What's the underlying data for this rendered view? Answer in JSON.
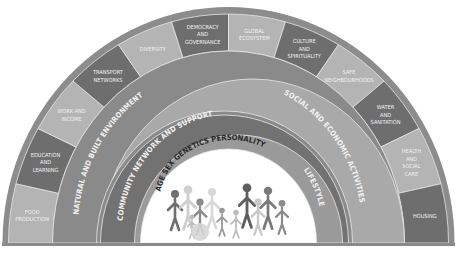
{
  "diagram": {
    "colors": {
      "outer_rim": "#8c8c8c",
      "segment_dark": "#6e6e6e",
      "segment_light": "#b4b4b4",
      "segment_divider": "#e6e6e6",
      "natural_built_band": "#8a8a8a",
      "social_economic_band": "#a9a9a9",
      "community_band": "#727272",
      "lifestyle_band": "#9a9a9a",
      "core": "#ffffff",
      "baseline": "#808080"
    },
    "outer_segments": [
      {
        "lines": [
          "FOOD",
          "PRODUCTION"
        ],
        "shade": "light"
      },
      {
        "lines": [
          "EDUCATION",
          "AND",
          "LEARNING"
        ],
        "shade": "dark"
      },
      {
        "lines": [
          "WORK AND",
          "INCOME"
        ],
        "shade": "light"
      },
      {
        "lines": [
          "TRANSPORT",
          "NETWORKS"
        ],
        "shade": "dark"
      },
      {
        "lines": [
          "DIVERSITY"
        ],
        "shade": "light"
      },
      {
        "lines": [
          "DEMOCRACY",
          "AND",
          "GOVERNANCE"
        ],
        "shade": "dark"
      },
      {
        "lines": [
          "GLOBAL",
          "ECOSYSTEM"
        ],
        "shade": "light"
      },
      {
        "lines": [
          "CULTURE",
          "AND",
          "SPIRITUALITY"
        ],
        "shade": "dark"
      },
      {
        "lines": [
          "SAFE",
          "NEIGHBOURHOODS"
        ],
        "shade": "light"
      },
      {
        "lines": [
          "WATER",
          "AND",
          "SANITATION"
        ],
        "shade": "dark"
      },
      {
        "lines": [
          "HEALTH",
          "AND",
          "SOCIAL",
          "CARE"
        ],
        "shade": "light"
      },
      {
        "lines": [
          "HOUSING"
        ],
        "shade": "dark"
      }
    ],
    "bands": {
      "natural_built": "NATURAL AND BUILT ENVIRONMENT",
      "social_economic": "SOCIAL AND ECONOMIC ACTIVITIES",
      "community": "COMMUNITY NETWORK AND SUPPORT",
      "lifestyle": "LIFESTYLE"
    },
    "core": {
      "label": "AGE SEX GENETICS PERSONALITY",
      "figures_icon": "people-group-icon"
    }
  }
}
